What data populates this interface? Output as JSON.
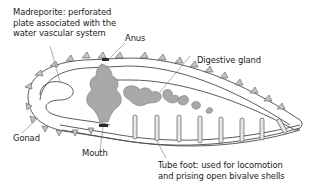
{
  "diagram": {
    "labels": {
      "madreporite": [
        "Madreporite: perforated",
        "plate associated with the",
        "water vascular system"
      ],
      "anus": "Anus",
      "digestive_gland": "Digestive gland",
      "gonad": "Gonad",
      "mouth": "Mouth",
      "tube_foot": [
        "Tube foot: used for locomotion",
        "and prising open bivalve shells"
      ]
    },
    "colors": {
      "fill_gray": "#a8a8a8",
      "outline": "#4a4a4a",
      "spine": "#c4c4c4",
      "label": "#1a1a1a"
    }
  }
}
